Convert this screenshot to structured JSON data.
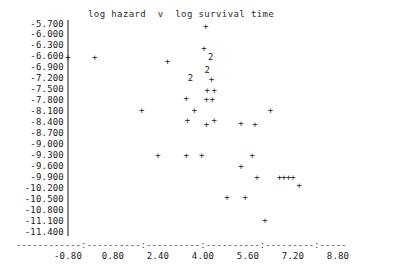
{
  "chart_data": {
    "type": "scatter",
    "title": "log hazard  v  log survival time",
    "xlabel": "",
    "ylabel": "",
    "xlim": [
      -1.6,
      8.8
    ],
    "ylim": [
      -11.55,
      -5.55
    ],
    "grid": false,
    "legend": null,
    "x_ticks": [
      "-0.80",
      "0.80",
      "2.40",
      "4.00",
      "5.60",
      "7.20",
      "8.80"
    ],
    "x_tick_values": [
      -0.8,
      0.8,
      2.4,
      4.0,
      5.6,
      7.2,
      8.8
    ],
    "y_ticks": [
      "-5.700",
      "-6.000",
      "-6.300",
      "-6.600",
      "-6.900",
      "-7.200",
      "-7.500",
      "-7.800",
      "-8.100",
      "-8.400",
      "-8.700",
      "-9.000",
      "-9.300",
      "-9.600",
      "-9.900",
      "-10.200",
      "-10.500",
      "-10.800",
      "-11.100",
      "-11.400"
    ],
    "y_tick_values": [
      -5.7,
      -6.0,
      -6.3,
      -6.6,
      -6.9,
      -7.2,
      -7.5,
      -7.8,
      -8.1,
      -8.4,
      -8.7,
      -9.0,
      -9.3,
      -9.6,
      -9.9,
      -10.2,
      -10.5,
      -10.8,
      -11.1,
      -11.4
    ],
    "marker": "+",
    "overlap_marker": "2",
    "overlap_note": "A '2' glyph marks a plot cell containing two coincident observations.",
    "points": [
      {
        "x": -0.8,
        "y": -6.6,
        "m": "+",
        "n": 1
      },
      {
        "x": 0.15,
        "y": -6.6,
        "m": "+",
        "n": 1
      },
      {
        "x": 4.1,
        "y": -5.76,
        "m": "+",
        "n": 1
      },
      {
        "x": 4.03,
        "y": -6.36,
        "m": "+",
        "n": 1
      },
      {
        "x": 4.27,
        "y": -6.6,
        "m": "2",
        "n": 2
      },
      {
        "x": 2.74,
        "y": -6.72,
        "m": "+",
        "n": 1
      },
      {
        "x": 4.15,
        "y": -6.95,
        "m": "2",
        "n": 2
      },
      {
        "x": 3.55,
        "y": -7.17,
        "m": "2",
        "n": 2
      },
      {
        "x": 4.3,
        "y": -7.2,
        "m": "+",
        "n": 1
      },
      {
        "x": 4.15,
        "y": -7.5,
        "m": "+",
        "n": 1
      },
      {
        "x": 4.4,
        "y": -7.5,
        "m": "+",
        "n": 1
      },
      {
        "x": 3.4,
        "y": -7.72,
        "m": "+",
        "n": 1
      },
      {
        "x": 4.12,
        "y": -7.76,
        "m": "+",
        "n": 1
      },
      {
        "x": 4.33,
        "y": -7.76,
        "m": "+",
        "n": 1
      },
      {
        "x": 1.82,
        "y": -8.05,
        "m": "+",
        "n": 1
      },
      {
        "x": 3.7,
        "y": -8.05,
        "m": "+",
        "n": 1
      },
      {
        "x": 6.4,
        "y": -8.05,
        "m": "+",
        "n": 1
      },
      {
        "x": 3.45,
        "y": -8.32,
        "m": "+",
        "n": 1
      },
      {
        "x": 4.4,
        "y": -8.32,
        "m": "+",
        "n": 1
      },
      {
        "x": 5.35,
        "y": -8.4,
        "m": "+",
        "n": 1
      },
      {
        "x": 4.12,
        "y": -8.43,
        "m": "+",
        "n": 1
      },
      {
        "x": 5.85,
        "y": -8.43,
        "m": "+",
        "n": 1
      },
      {
        "x": 2.4,
        "y": -9.3,
        "m": "+",
        "n": 1
      },
      {
        "x": 3.4,
        "y": -9.3,
        "m": "+",
        "n": 1
      },
      {
        "x": 3.95,
        "y": -9.3,
        "m": "+",
        "n": 1
      },
      {
        "x": 5.75,
        "y": -9.3,
        "m": "+",
        "n": 1
      },
      {
        "x": 5.35,
        "y": -9.6,
        "m": "+",
        "n": 1
      },
      {
        "x": 5.92,
        "y": -9.9,
        "m": "+",
        "n": 1
      },
      {
        "x": 6.72,
        "y": -9.9,
        "m": "+",
        "n": 1
      },
      {
        "x": 6.88,
        "y": -9.9,
        "m": "+",
        "n": 1
      },
      {
        "x": 7.04,
        "y": -9.9,
        "m": "+",
        "n": 1
      },
      {
        "x": 7.2,
        "y": -9.9,
        "m": "+",
        "n": 1
      },
      {
        "x": 7.42,
        "y": -10.12,
        "m": "+",
        "n": 1
      },
      {
        "x": 4.85,
        "y": -10.45,
        "m": "+",
        "n": 1
      },
      {
        "x": 5.5,
        "y": -10.45,
        "m": "+",
        "n": 1
      },
      {
        "x": 6.2,
        "y": -11.07,
        "m": "+",
        "n": 1
      }
    ]
  }
}
